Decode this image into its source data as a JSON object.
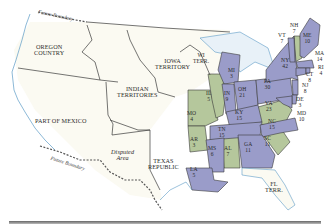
{
  "map": {
    "colors": {
      "background": "#ffffff",
      "territory": "#fbfaf2",
      "party_a": "#9a9cc9",
      "party_b": "#b5c79c",
      "water": "#e8f1f8",
      "coast": "#5c9bc6",
      "border": "#3a3a3a"
    },
    "regions": {
      "oregon": "OREGON\nCOUNTRY",
      "iowa": "IOWA\nTERRITORY",
      "wi": "WI\nTERR.",
      "indian": "INDIAN\nTERRITORIES",
      "mexico": "PART OF MEXICO",
      "disputed": "Disputed\nArea",
      "texas": "TEXAS\nREPUBLIC",
      "fl": "FL\nTERR.",
      "future_boundary_north": "Future Boundary",
      "future_boundary_south": "Future Boundary"
    },
    "states": [
      {
        "abbr": "ME",
        "ev": "10",
        "party": "a"
      },
      {
        "abbr": "NH",
        "ev": "7",
        "party": "b"
      },
      {
        "abbr": "VT",
        "ev": "7",
        "party": "a"
      },
      {
        "abbr": "MA",
        "ev": "14",
        "party": "a"
      },
      {
        "abbr": "RI",
        "ev": "4",
        "party": "a"
      },
      {
        "abbr": "CT",
        "ev": "8",
        "party": "a"
      },
      {
        "abbr": "NY",
        "ev": "42",
        "party": "a"
      },
      {
        "abbr": "NJ",
        "ev": "8",
        "party": "a"
      },
      {
        "abbr": "DE",
        "ev": "3",
        "party": "a"
      },
      {
        "abbr": "MD",
        "ev": "10",
        "party": "a"
      },
      {
        "abbr": "PA",
        "ev": "30",
        "party": "a"
      },
      {
        "abbr": "VA",
        "ev": "23",
        "party": "b"
      },
      {
        "abbr": "NC",
        "ev": "15",
        "party": "a"
      },
      {
        "abbr": "SC",
        "ev": "11",
        "party": "b"
      },
      {
        "abbr": "GA",
        "ev": "11",
        "party": "a"
      },
      {
        "abbr": "OH",
        "ev": "21",
        "party": "a"
      },
      {
        "abbr": "MI",
        "ev": "3",
        "party": "a"
      },
      {
        "abbr": "IN",
        "ev": "9",
        "party": "a"
      },
      {
        "abbr": "IL",
        "ev": "5",
        "party": "b"
      },
      {
        "abbr": "KY",
        "ev": "15",
        "party": "a"
      },
      {
        "abbr": "TN",
        "ev": "15",
        "party": "a"
      },
      {
        "abbr": "AL",
        "ev": "7",
        "party": "b"
      },
      {
        "abbr": "MS",
        "ev": "6",
        "party": "a"
      },
      {
        "abbr": "LA",
        "ev": "5",
        "party": "a"
      },
      {
        "abbr": "AR",
        "ev": "3",
        "party": "b"
      },
      {
        "abbr": "MO",
        "ev": "4",
        "party": "b"
      }
    ]
  }
}
